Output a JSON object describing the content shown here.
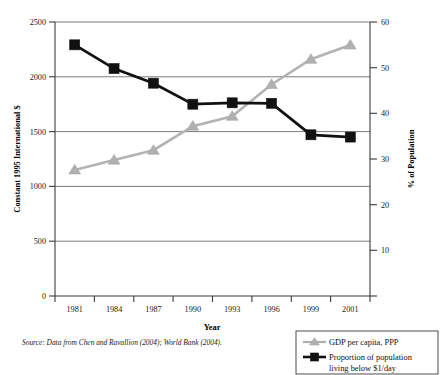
{
  "chart_data": {
    "type": "line",
    "title": "",
    "xlabel": "Year",
    "x": [
      1981,
      1984,
      1987,
      1990,
      1993,
      1996,
      1999,
      2001
    ],
    "xticklabels": [
      "1981",
      "1984",
      "1987",
      "1990",
      "1993",
      "1996",
      "1999",
      "2001"
    ],
    "grid": true,
    "legend_position": "bottom-right",
    "left_axis": {
      "label": "Constant 1995 International $",
      "ylim": [
        0,
        2500
      ],
      "ticks": [
        0,
        500,
        1000,
        1500,
        2000,
        2500
      ],
      "ticklabels": [
        "0",
        "500",
        "1000",
        "1500",
        "2000",
        "2500"
      ]
    },
    "right_axis": {
      "label": "% of Population",
      "ylim": [
        0,
        60
      ],
      "ticks": [
        0,
        10,
        20,
        30,
        40,
        50,
        60
      ],
      "ticklabels": [
        "0",
        "10",
        "20",
        "30",
        "40",
        "50",
        "60"
      ]
    },
    "series": [
      {
        "name": "GDP per capita, PPP",
        "axis": "left",
        "marker": "triangle",
        "color": "#b0b0b0",
        "values": [
          1150,
          1240,
          1330,
          1550,
          1640,
          1930,
          2160,
          2290
        ]
      },
      {
        "name": "Proportion of population living below $1/day",
        "axis": "right",
        "marker": "square",
        "color": "#111111",
        "values": [
          55.0,
          49.8,
          46.6,
          42.0,
          42.3,
          42.2,
          35.3,
          34.8
        ]
      }
    ],
    "source_note": "Source: Data from Chen and Ravallion (2004); World Bank (2004)."
  },
  "legend": {
    "items": [
      {
        "label": "GDP per capita, PPP",
        "marker": "triangle",
        "color": "#b0b0b0"
      },
      {
        "label": "Proportion of population",
        "marker": "square",
        "color": "#111111"
      },
      {
        "label": "living below $1/day",
        "marker": "none",
        "color": "#111111"
      }
    ]
  },
  "labels": {
    "left_axis_title": "Constant 1995 International $",
    "right_axis_title": "% of Population",
    "x_axis_title": "Year",
    "source": "Source: Data from Chen and Ravallion (2004); World Bank (2004).",
    "y_left_0": "0",
    "y_left_500": "500",
    "y_left_1000": "1000",
    "y_left_1500": "1500",
    "y_left_2000": "2000",
    "y_left_2500": "2500",
    "y_right_0": "0",
    "y_right_10": "10",
    "y_right_20": "20",
    "y_right_30": "30",
    "y_right_40": "40",
    "y_right_50": "50",
    "y_right_60": "60",
    "x_1981": "1981",
    "x_1984": "1984",
    "x_1987": "1987",
    "x_1990": "1990",
    "x_1993": "1993",
    "x_1996": "1996",
    "x_1999": "1999",
    "x_2001": "2001"
  }
}
